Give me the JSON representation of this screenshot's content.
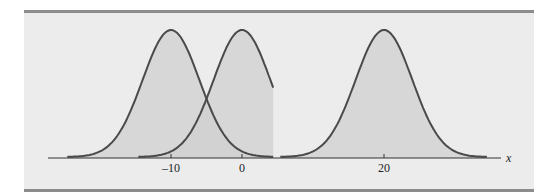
{
  "chart_data": {
    "type": "area",
    "title": "",
    "xlabel": "x",
    "ylabel": "",
    "grid": false,
    "legend": null,
    "series": [
      {
        "name": "Normal curve (mean -10)",
        "mean": -10,
        "sd": 4,
        "x_range": [
          -24.6,
          4.4
        ]
      },
      {
        "name": "Normal curve (mean 0)",
        "mean": 0,
        "sd": 4,
        "x_range": [
          -14.6,
          4.4
        ]
      },
      {
        "name": "Normal curve (mean 20)",
        "mean": 20,
        "sd": 4,
        "x_range": [
          5.4,
          34.5
        ]
      }
    ],
    "x_ticks": [
      {
        "value": -10,
        "label": "-10"
      },
      {
        "value": 0,
        "label": "0"
      },
      {
        "value": 20,
        "label": "20"
      }
    ],
    "xlim": [
      -27,
      36.5
    ]
  },
  "axis": {
    "x_label": "x"
  },
  "ticks": [
    "-10",
    "0",
    "20"
  ],
  "colors": {
    "panel_bg": "#ececec",
    "border": "#8c8c8c",
    "fill": "#d0d0d0",
    "stroke": "#4a4a4a"
  }
}
